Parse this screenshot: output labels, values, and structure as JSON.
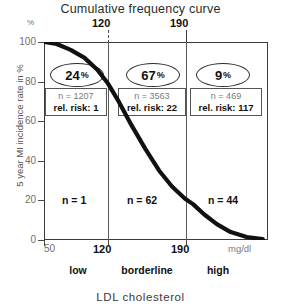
{
  "chart_data": {
    "type": "line",
    "title": "Cumulative frequency curve",
    "xlabel": "LDL  cholesterol",
    "ylabel": "5 year MI incidence rate in %",
    "y_unit_symbol": "%",
    "x_unit": "mg/dl",
    "xlim": [
      50,
      260
    ],
    "ylim": [
      0,
      100
    ],
    "grid": false,
    "legend": "none",
    "x_ticks": [
      "50",
      "120",
      "190"
    ],
    "y_ticks": [
      "0",
      "20",
      "40",
      "60",
      "80",
      "100"
    ],
    "top_markers": [
      "120",
      "190"
    ],
    "series": [
      {
        "name": "Cumulative frequency",
        "x": [
          50,
          62,
          75,
          88,
          100,
          110,
          120,
          132,
          145,
          158,
          170,
          182,
          190,
          200,
          212,
          225,
          240,
          255
        ],
        "values": [
          100,
          99,
          96,
          92,
          86,
          79,
          70,
          58,
          46,
          35,
          27,
          21,
          18,
          13,
          8,
          4,
          1.5,
          0.5
        ]
      }
    ],
    "bands": [
      {
        "label": "low",
        "range": [
          50,
          120
        ],
        "percent": "24",
        "percent_symbol": "%",
        "n": "n = 1207",
        "rel_risk": "rel. risk: 1",
        "events": "n = 1"
      },
      {
        "label": "borderline",
        "range": [
          120,
          190
        ],
        "percent": "67",
        "percent_symbol": "%",
        "n": "n = 3563",
        "rel_risk": "rel. risk: 22",
        "events": "n = 62"
      },
      {
        "label": "high",
        "range": [
          190,
          260
        ],
        "percent": "9",
        "percent_symbol": "%",
        "n": "n = 469",
        "rel_risk": "rel. risk: 117",
        "events": "n = 44"
      }
    ],
    "colors": {
      "curve": "#111111",
      "frame": "#3a3a3a",
      "muted_text": "#7b7b7b"
    }
  }
}
